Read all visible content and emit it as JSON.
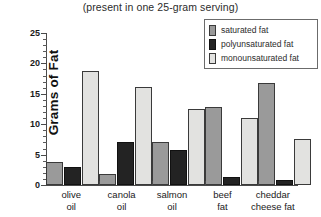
{
  "chart_data": {
    "type": "bar",
    "title": "(present in one 25-gram serving)",
    "xlabel": "",
    "ylabel": "Grams of Fat",
    "ylim": [
      0,
      25
    ],
    "yticks": [
      0,
      5,
      10,
      15,
      20,
      25
    ],
    "ytick_labels": [
      "0",
      "5",
      "10",
      "15",
      "20",
      "25"
    ],
    "minor_tick_step": 1,
    "grid": false,
    "legend_position": "top-right",
    "categories": [
      "olive oil",
      "canola oil",
      "salmon oil",
      "beef fat",
      "cheddar cheese fat"
    ],
    "category_lines": [
      [
        "olive",
        "oil"
      ],
      [
        "canola",
        "oil"
      ],
      [
        "salmon",
        "oil"
      ],
      [
        "beef",
        "fat"
      ],
      [
        "cheddar",
        "cheese fat"
      ]
    ],
    "series": [
      {
        "name": "saturated fat",
        "color": "#9a9a9a",
        "values": [
          3.8,
          1.8,
          7.0,
          12.8,
          16.7
        ]
      },
      {
        "name": "polyunsaturated fat",
        "color": "#232323",
        "values": [
          2.9,
          7.0,
          5.8,
          1.3,
          0.9
        ]
      },
      {
        "name": "monounsaturated fat",
        "color": "#e2e2e0",
        "values": [
          18.8,
          16.2,
          12.5,
          11.0,
          7.6
        ]
      }
    ]
  }
}
